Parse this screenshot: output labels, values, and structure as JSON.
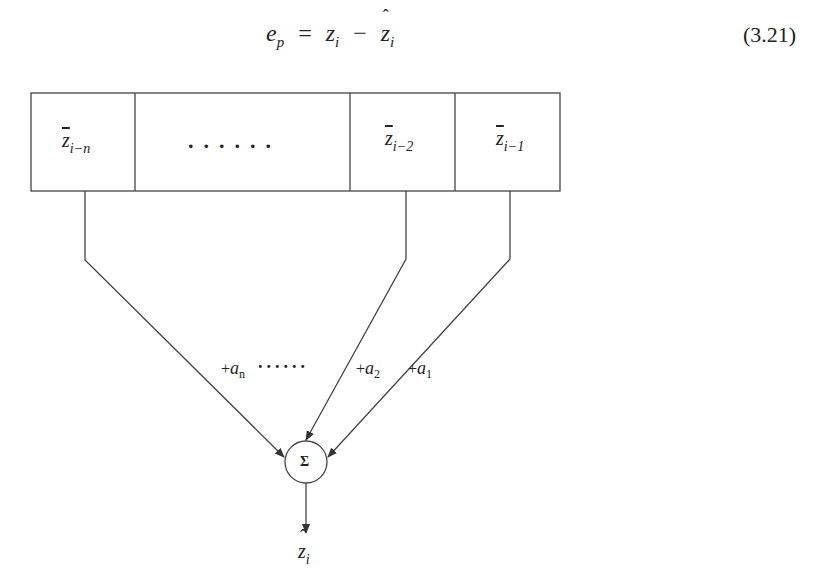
{
  "equation": {
    "lhs": "e",
    "lhs_sub": "p",
    "equals": "=",
    "term1": "z",
    "term1_sub": "i",
    "minus": "−",
    "term2": "z",
    "term2_sub": "i",
    "number": "(3.21)"
  },
  "register": {
    "cells": [
      {
        "symbol": "z",
        "sub": "i−n"
      },
      {
        "dots": "......"
      },
      {
        "symbol": "z",
        "sub": "i−2"
      },
      {
        "symbol": "z",
        "sub": "i−1"
      }
    ]
  },
  "weights": {
    "wn": {
      "prefix": "+",
      "symbol": "a",
      "sub": "n"
    },
    "dots": "......",
    "w2": {
      "prefix": "+",
      "symbol": "a",
      "sub": "2"
    },
    "w1": {
      "prefix": "+",
      "symbol": "a",
      "sub": "1"
    }
  },
  "summer": {
    "symbol": "Σ"
  },
  "output": {
    "symbol": "z",
    "sub": "i"
  }
}
